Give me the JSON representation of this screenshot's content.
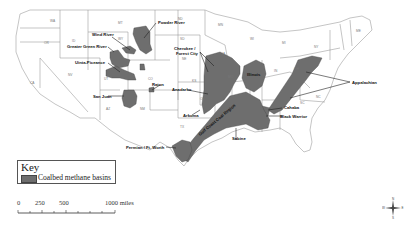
{
  "map": {
    "title": "",
    "basin_color": "#6e6e6e",
    "state_border_color": "#8a8a8a",
    "basins": [
      {
        "name": "Powder River",
        "label": "Powder River"
      },
      {
        "name": "Wind River",
        "label": "Wind River"
      },
      {
        "name": "Greater Green River",
        "label": "Greater Green River"
      },
      {
        "name": "Uinta-Piceance",
        "label": "Uinta-Piceance"
      },
      {
        "name": "San Juan",
        "label": "San Juan"
      },
      {
        "name": "Raton",
        "label": "Raton"
      },
      {
        "name": "Cherokee / Forest City",
        "label_line1": "Cherokee /",
        "label_line2": "Forest City"
      },
      {
        "name": "Anadarko",
        "label": "Anadarko"
      },
      {
        "name": "Arkoma",
        "label": "Arkoma"
      },
      {
        "name": "Illinois",
        "label": "Illinois"
      },
      {
        "name": "Appalachian",
        "label": "Appalachian"
      },
      {
        "name": "Cahaba",
        "label": "Cahaba"
      },
      {
        "name": "Black Warrior",
        "label": "Black Warrior"
      },
      {
        "name": "Gulf Coast Coal Region",
        "label": "Gulf Coast Coal Region"
      },
      {
        "name": "Sabine",
        "label": "Sabine"
      },
      {
        "name": "Permian / Ft. Worth",
        "label": "Permian / Ft. Worth"
      }
    ],
    "states": [
      "WA",
      "OR",
      "CA",
      "NV",
      "ID",
      "MT",
      "WY",
      "UT",
      "AZ",
      "CO",
      "NM",
      "ND",
      "SD",
      "NE",
      "KS",
      "OK",
      "TX",
      "MN",
      "IA",
      "MO",
      "AR",
      "LA",
      "WI",
      "IL",
      "MI",
      "IN",
      "OH",
      "KY",
      "TN",
      "MS",
      "AL",
      "GA",
      "FL",
      "SC",
      "NC",
      "VA",
      "WV",
      "PA",
      "NY",
      "VT",
      "NH",
      "ME",
      "MA"
    ]
  },
  "legend": {
    "title": "Key",
    "items": [
      {
        "label": "Coalbed methane basins",
        "color": "#6e6e6e"
      }
    ]
  },
  "scale_bar": {
    "ticks": [
      "0",
      "250",
      "500",
      "1000 miles"
    ]
  },
  "compass": {
    "n": "N",
    "s": "S",
    "e": "E",
    "w": "W"
  }
}
